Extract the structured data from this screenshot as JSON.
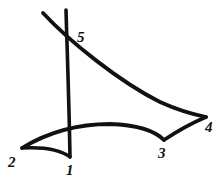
{
  "figure": {
    "background_color": "#ffffff",
    "ink_color": "#111111",
    "canvas": {
      "width": 224,
      "height": 183
    }
  },
  "labels": [
    {
      "id": "label-1",
      "text": "1",
      "x": 66,
      "y": 163
    },
    {
      "id": "label-2",
      "text": "2",
      "x": 8,
      "y": 155
    },
    {
      "id": "label-3",
      "text": "3",
      "x": 158,
      "y": 146
    },
    {
      "id": "label-4",
      "text": "4",
      "x": 205,
      "y": 120
    },
    {
      "id": "label-5",
      "text": "5",
      "x": 77,
      "y": 30
    }
  ],
  "vertices": [
    {
      "name": "1",
      "x": 70,
      "y": 157
    },
    {
      "name": "2",
      "x": 22,
      "y": 148
    },
    {
      "name": "3",
      "x": 164,
      "y": 140
    },
    {
      "name": "4",
      "x": 206,
      "y": 117
    },
    {
      "name": "5",
      "x": 70,
      "y": 37
    }
  ],
  "strokes": [
    {
      "name": "vertical-edge-5-to-1",
      "d": "M 66 10 C 67 45, 69 100, 70 157",
      "width": 3.6
    },
    {
      "name": "diagonal-edge-5-to-4",
      "d": "M 43 13 C 70 42, 120 82, 160 102 C 180 111, 196 115, 206 117",
      "width": 3.8
    },
    {
      "name": "lower-edge-2-to-3",
      "d": "M 22 148 C 50 131, 80 124, 110 124 C 140 125, 155 131, 164 140",
      "width": 3.8
    },
    {
      "name": "inner-arc-2-to-1",
      "d": "M 22 148 C 40 147, 58 148, 70 157",
      "width": 3.4
    },
    {
      "name": "right-edge-3-to-4",
      "d": "M 164 140 C 176 132, 192 123, 206 117",
      "width": 3.6
    }
  ]
}
